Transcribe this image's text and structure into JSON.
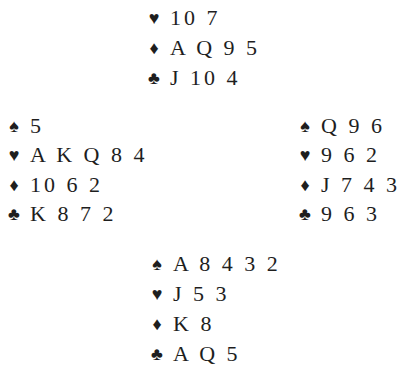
{
  "diagram": {
    "type": "bridge-deal",
    "hands": {
      "north": {
        "hearts": "10 7",
        "diamonds": "A Q 9 5",
        "clubs": "J 10 4"
      },
      "west": {
        "spades": "5",
        "hearts": "A K Q 8 4",
        "diamonds": "10 6 2",
        "clubs": "K 8 7 2"
      },
      "east": {
        "spades": "Q 9 6",
        "hearts": "9 6 2",
        "diamonds": "J 7 4 3",
        "clubs": "9 6 3"
      },
      "south": {
        "spades": "A 8 4 3 2",
        "hearts": "J 5 3",
        "diamonds": "K 8",
        "clubs": "A Q 5"
      }
    },
    "suit_symbols": {
      "spades": "♠",
      "hearts": "♥",
      "diamonds": "♦",
      "clubs": "♣"
    }
  }
}
